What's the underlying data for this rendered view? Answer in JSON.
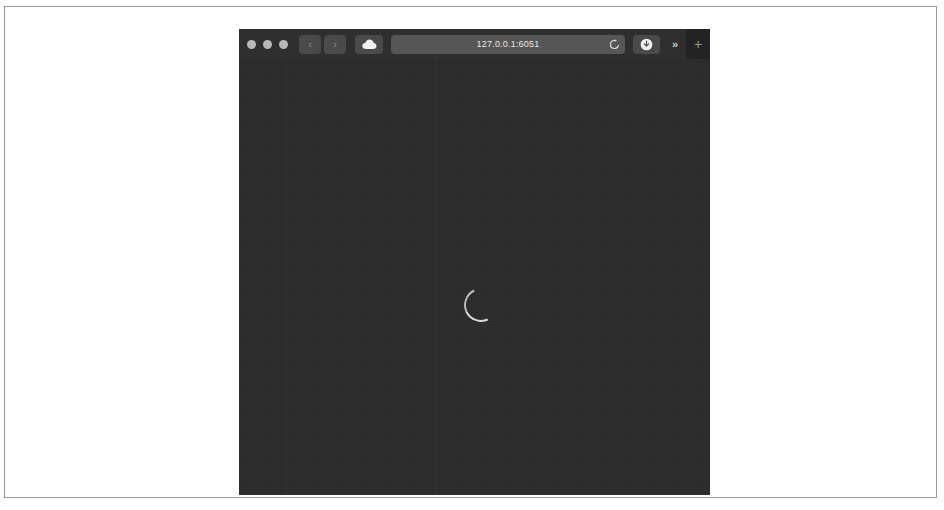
{
  "window": {
    "title": "Safari Browser Window",
    "traffic_lights": [
      {
        "name": "close",
        "color": "#b9b9b9"
      },
      {
        "name": "minimize",
        "color": "#b9b9b9"
      },
      {
        "name": "zoom",
        "color": "#b9b9b9"
      }
    ]
  },
  "toolbar": {
    "back_label": "‹",
    "forward_label": "›",
    "sidebar_icon": "cloud-icon",
    "overflow_label": "»",
    "new_tab_label": "+",
    "share_icon": "download-icon",
    "reload_icon": "reload-icon"
  },
  "address": {
    "url": "127.0.0.1:6051",
    "placeholder": "Search or enter website name"
  },
  "content": {
    "state": "loading",
    "spinner_label": "Loading",
    "background_color": "#2c2c2c"
  },
  "colors": {
    "window_chrome": "#2f2f2f",
    "content_background": "#2c2c2c",
    "toolbar_button": "#4a4a4a",
    "address_field": "#565656",
    "page_frame_border": "#9a9a9a",
    "spinner": "#d8d8d8"
  }
}
